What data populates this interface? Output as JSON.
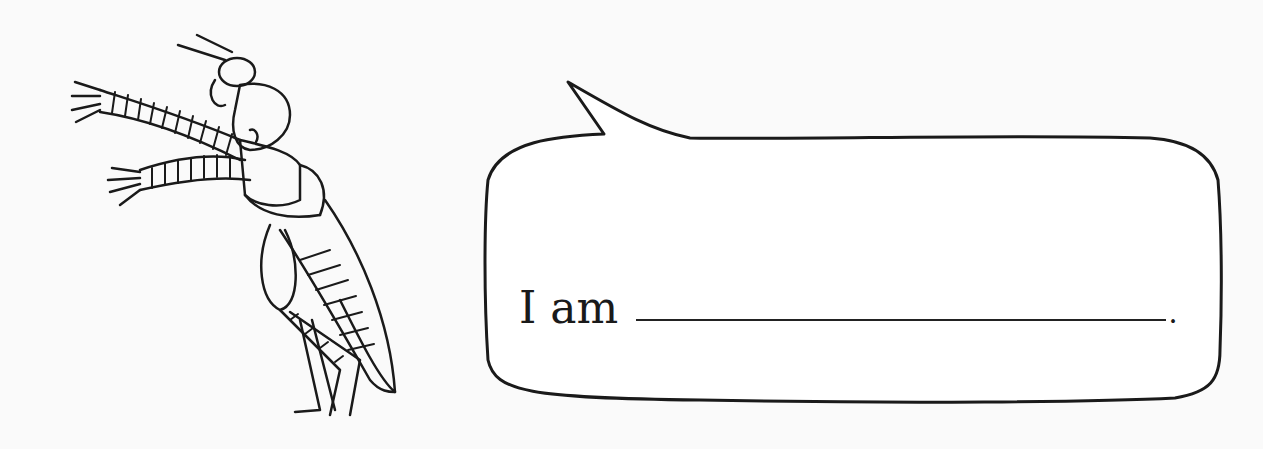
{
  "worksheet": {
    "prompt": {
      "label": "I am",
      "blank_line": "",
      "ending_punctuation": "."
    },
    "illustration": {
      "subject": "grasshopper wearing a striped scarf and earmuffs",
      "style": "black line drawing"
    },
    "speech_bubble": {
      "shape": "rounded rectangle with tail pointing up-left"
    },
    "colors": {
      "ink": "#1a1a1a",
      "paper": "#fafafa"
    }
  }
}
